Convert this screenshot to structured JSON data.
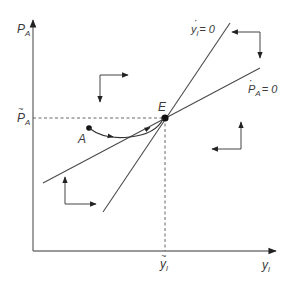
{
  "diagram": {
    "type": "phase-diagram",
    "axes": {
      "y_label_main": "P",
      "y_label_sub": "A",
      "x_label_main": "y",
      "x_label_sub": "l"
    },
    "equilibrium": {
      "label": "E",
      "y_tick_main": "P",
      "y_tick_sub": "A",
      "y_tick_accent": "~",
      "x_tick_main": "y",
      "x_tick_sub": "l",
      "x_tick_accent": "~"
    },
    "loci": [
      {
        "id": "yl-dot-zero",
        "label_main": "y",
        "label_sub": "l",
        "label_rest": "= 0",
        "dot": "·"
      },
      {
        "id": "pa-dot-zero",
        "label_main": "P",
        "label_sub": "A",
        "label_rest": "= 0",
        "dot": "·"
      }
    ],
    "start_point": {
      "label": "A"
    },
    "colors": {
      "line": "#4a4a4a",
      "axis": "#777777",
      "dashed": "#666666",
      "point": "#111111"
    }
  }
}
